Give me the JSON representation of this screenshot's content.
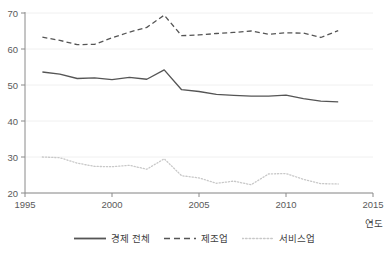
{
  "chart_data": {
    "type": "line",
    "title": "",
    "subtitle": "",
    "xlabel": "연도",
    "ylabel": "",
    "xlim": [
      1995,
      2015
    ],
    "ylim": [
      20,
      70
    ],
    "xticks": [
      1995,
      2000,
      2005,
      2010,
      2015
    ],
    "yticks": [
      20,
      30,
      40,
      50,
      60,
      70
    ],
    "grid": "horizontal",
    "legend_position": "bottom-center",
    "x": [
      1996,
      1997,
      1998,
      1999,
      2000,
      2001,
      2002,
      2003,
      2004,
      2005,
      2006,
      2007,
      2008,
      2009,
      2010,
      2011,
      2012,
      2013
    ],
    "series": [
      {
        "name": "경제 전체",
        "style": "solid",
        "color": "#555555",
        "values": [
          53.6,
          53.0,
          51.8,
          52.0,
          51.5,
          52.1,
          51.6,
          54.2,
          48.7,
          48.2,
          47.4,
          47.1,
          46.9,
          46.9,
          47.2,
          46.2,
          45.5,
          45.3
        ]
      },
      {
        "name": "제조업",
        "style": "dashed",
        "color": "#555555",
        "values": [
          63.3,
          62.4,
          61.2,
          61.3,
          63.1,
          64.7,
          66.0,
          69.4,
          63.7,
          63.9,
          64.3,
          64.6,
          65.0,
          64.1,
          64.5,
          64.4,
          63.2,
          65.1
        ]
      },
      {
        "name": "서비스업",
        "style": "dotted",
        "color": "#c8c8c8",
        "values": [
          30.0,
          29.8,
          28.3,
          27.4,
          27.3,
          27.7,
          26.6,
          29.5,
          24.8,
          24.2,
          22.7,
          23.3,
          22.3,
          25.3,
          25.4,
          23.8,
          22.6,
          22.5
        ]
      }
    ]
  },
  "legend": {
    "items": [
      {
        "label": "경제 전체",
        "style": "solid"
      },
      {
        "label": "제조업",
        "style": "dashed"
      },
      {
        "label": "서비스업",
        "style": "dotted"
      }
    ]
  },
  "axes": {
    "x_title": "연도",
    "x_tick_labels": [
      "1995",
      "2000",
      "2005",
      "2010",
      "2015"
    ],
    "y_tick_labels": [
      "20",
      "30",
      "40",
      "50",
      "60",
      "70"
    ]
  },
  "colors": {
    "line_dark": "#555555",
    "line_light": "#c8c8c8",
    "grid": "#f0f0f0",
    "axis": "#8a8a8a",
    "text": "#4d4d4d"
  }
}
